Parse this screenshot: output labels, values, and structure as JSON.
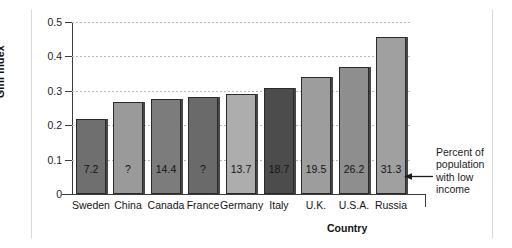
{
  "chart_data": {
    "type": "bar",
    "title": "",
    "xlabel": "Country",
    "ylabel": "Gini index",
    "ylim": [
      0,
      0.5
    ],
    "ytick_labels": [
      "0",
      "0.1",
      "0.2",
      "0.3",
      "0.4",
      "0.5"
    ],
    "ytick_values": [
      0,
      0.1,
      0.2,
      0.3,
      0.4,
      0.5
    ],
    "grid": true,
    "legend": "none",
    "categories": [
      "Sweden",
      "China",
      "Canada",
      "France",
      "Germany",
      "Italy",
      "U.K.",
      "U.S.A.",
      "Russia"
    ],
    "values": [
      0.217,
      0.268,
      0.275,
      0.281,
      0.29,
      0.309,
      0.339,
      0.368,
      0.456
    ],
    "bar_labels": [
      "7.2",
      "?",
      "14.4",
      "?",
      "13.7",
      "18.7",
      "19.5",
      "26.2",
      "31.3"
    ],
    "bar_label_meaning": "Percent of population with low income",
    "bar_colors": [
      "#6f6f6f",
      "#9a9a9a",
      "#7c7c7c",
      "#6a6a6a",
      "#adadad",
      "#4c4c4c",
      "#9d9d9d",
      "#8e8e8e",
      "#a0a0a0"
    ],
    "annotation": {
      "lines": [
        "Percent of",
        "population",
        "with low",
        "income"
      ],
      "arrow": "left-arrow-icon",
      "points_to": "bar-label-russia"
    }
  }
}
